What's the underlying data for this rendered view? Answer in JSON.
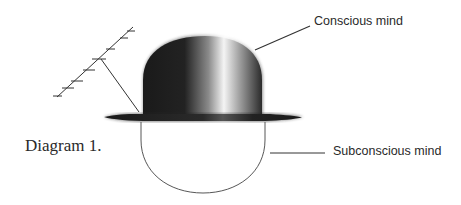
{
  "diagram": {
    "caption": "Diagram 1.",
    "labels": {
      "conscious": "Conscious mind",
      "subconscious": "Subconscious mind"
    },
    "elements": [
      "antenna",
      "bowler-hat",
      "head-outline"
    ],
    "colors": {
      "hat_dark": "#1a1a1a",
      "hat_highlight": "#f2f2f2",
      "line": "#333333",
      "text": "#2a2a2a",
      "background": "#ffffff"
    }
  }
}
